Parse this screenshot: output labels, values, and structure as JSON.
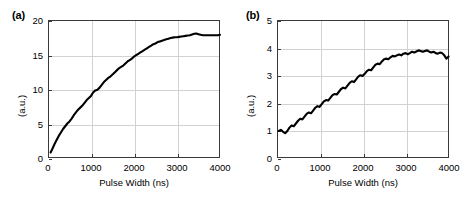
{
  "figure": {
    "background": "#ffffff",
    "curve_color": "#000000",
    "grid_color": "#d2d2d2",
    "axis_color": "#3a3a3a"
  },
  "panels": [
    {
      "label": "(a)",
      "xlabel": "Pulse Width (ns)",
      "ylabel": "(a.u.)",
      "xticks": [
        "0",
        "1000",
        "2000",
        "3000",
        "4000"
      ],
      "yticks": [
        "0",
        "5",
        "10",
        "15",
        "20"
      ]
    },
    {
      "label": "(b)",
      "xlabel": "Pulse Width (ns)",
      "ylabel": "(a.u.)",
      "xticks": [
        "0",
        "1000",
        "2000",
        "3000",
        "4000"
      ],
      "yticks": [
        "0",
        "1",
        "2",
        "3",
        "4",
        "5"
      ]
    }
  ],
  "chart_data": [
    {
      "type": "line",
      "panel": "(a)",
      "title": "",
      "xlabel": "Pulse Width (ns)",
      "ylabel": "(a.u.)",
      "xlim": [
        0,
        4000
      ],
      "ylim": [
        0,
        20
      ],
      "xticks": [
        0,
        1000,
        2000,
        3000,
        4000
      ],
      "yticks": [
        0,
        5,
        10,
        15,
        20
      ],
      "grid": true,
      "legend": false,
      "series": [
        {
          "name": "signal",
          "x": [
            60,
            100,
            150,
            200,
            250,
            300,
            350,
            400,
            450,
            500,
            550,
            600,
            650,
            700,
            750,
            800,
            850,
            900,
            950,
            1000,
            1050,
            1100,
            1150,
            1200,
            1250,
            1300,
            1350,
            1400,
            1450,
            1500,
            1550,
            1600,
            1650,
            1700,
            1750,
            1800,
            1850,
            1900,
            1950,
            2000,
            2050,
            2100,
            2150,
            2200,
            2250,
            2300,
            2350,
            2400,
            2450,
            2500,
            2550,
            2600,
            2650,
            2700,
            2750,
            2800,
            2850,
            2900,
            2950,
            3000,
            3050,
            3100,
            3150,
            3200,
            3250,
            3300,
            3350,
            3400,
            3450,
            3500,
            3550,
            3600,
            3650,
            3700,
            3750,
            3800,
            3850,
            3900,
            3950,
            4000
          ],
          "y": [
            0.8,
            1.3,
            2.0,
            2.6,
            3.2,
            3.7,
            4.2,
            4.6,
            5.0,
            5.3,
            5.7,
            6.2,
            6.6,
            7.0,
            7.3,
            7.6,
            8.0,
            8.4,
            8.7,
            9.0,
            9.5,
            9.8,
            9.9,
            10.2,
            10.6,
            11.0,
            11.3,
            11.6,
            11.8,
            12.1,
            12.4,
            12.7,
            13.0,
            13.2,
            13.4,
            13.7,
            14.0,
            14.2,
            14.4,
            14.7,
            14.9,
            15.1,
            15.3,
            15.5,
            15.7,
            15.9,
            16.1,
            16.3,
            16.5,
            16.6,
            16.8,
            16.9,
            17.0,
            17.1,
            17.2,
            17.3,
            17.4,
            17.45,
            17.5,
            17.5,
            17.55,
            17.6,
            17.65,
            17.7,
            17.75,
            17.8,
            17.9,
            18.0,
            18.05,
            17.95,
            17.85,
            17.8,
            17.8,
            17.8,
            17.8,
            17.8,
            17.8,
            17.8,
            17.8,
            17.85
          ]
        }
      ]
    },
    {
      "type": "line",
      "panel": "(b)",
      "title": "",
      "xlabel": "Pulse Width (ns)",
      "ylabel": "(a.u.)",
      "xlim": [
        0,
        4000
      ],
      "ylim": [
        0,
        5
      ],
      "xticks": [
        0,
        1000,
        2000,
        3000,
        4000
      ],
      "yticks": [
        0,
        1,
        2,
        3,
        4,
        5
      ],
      "grid": true,
      "legend": false,
      "series": [
        {
          "name": "signal",
          "x": [
            40,
            90,
            140,
            190,
            240,
            290,
            340,
            390,
            440,
            490,
            540,
            590,
            640,
            690,
            740,
            790,
            840,
            890,
            940,
            990,
            1040,
            1090,
            1140,
            1190,
            1240,
            1290,
            1340,
            1390,
            1440,
            1490,
            1540,
            1590,
            1640,
            1690,
            1740,
            1790,
            1840,
            1890,
            1940,
            1990,
            2040,
            2090,
            2140,
            2190,
            2240,
            2290,
            2340,
            2390,
            2440,
            2490,
            2540,
            2590,
            2640,
            2690,
            2740,
            2790,
            2840,
            2890,
            2940,
            2990,
            3040,
            3090,
            3140,
            3190,
            3240,
            3290,
            3340,
            3390,
            3440,
            3490,
            3540,
            3590,
            3640,
            3690,
            3740,
            3790,
            3840,
            3890,
            3940,
            3990
          ],
          "y": [
            0.98,
            1.02,
            0.95,
            0.9,
            0.98,
            1.1,
            1.18,
            1.15,
            1.25,
            1.35,
            1.42,
            1.4,
            1.5,
            1.6,
            1.65,
            1.62,
            1.72,
            1.82,
            1.88,
            1.85,
            1.95,
            2.05,
            2.1,
            2.08,
            2.18,
            2.28,
            2.32,
            2.3,
            2.4,
            2.5,
            2.55,
            2.52,
            2.62,
            2.72,
            2.78,
            2.75,
            2.85,
            2.95,
            3.0,
            2.97,
            3.05,
            3.15,
            3.2,
            3.18,
            3.28,
            3.38,
            3.42,
            3.4,
            3.5,
            3.58,
            3.6,
            3.58,
            3.65,
            3.7,
            3.68,
            3.72,
            3.75,
            3.72,
            3.78,
            3.8,
            3.76,
            3.8,
            3.85,
            3.82,
            3.86,
            3.9,
            3.88,
            3.85,
            3.88,
            3.9,
            3.85,
            3.82,
            3.85,
            3.8,
            3.78,
            3.82,
            3.8,
            3.72,
            3.6,
            3.68
          ]
        }
      ]
    }
  ]
}
